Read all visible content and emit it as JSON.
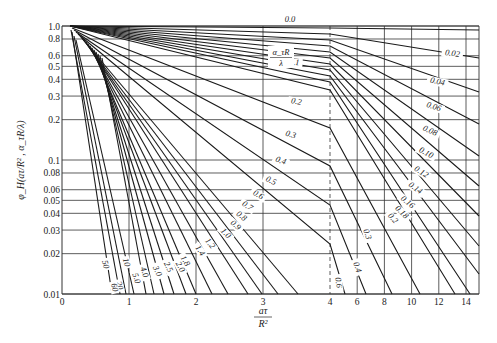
{
  "chart_data": {
    "type": "line",
    "title": "",
    "xlabel": "aτ/R²",
    "ylabel": "φ_H(aτ/R², α_τR/λ)",
    "yscale": "log",
    "ylim": [
      0.01,
      1.0
    ],
    "xlim": [
      0,
      15
    ],
    "x_axis_note": "Linear scale 0–4, compressed scale 4–14 beyond dashed line at 4",
    "x_ticks": [
      "0",
      "1",
      "2",
      "3",
      "4",
      "6",
      "8",
      "10",
      "12",
      "14"
    ],
    "y_ticks": [
      "1.0",
      "0.8",
      "0.6",
      "0.5",
      "0.4",
      "0.3",
      "0.2",
      "0.1",
      "0.08",
      "0.06",
      "0.05",
      "0.04",
      "0.03",
      "0.02",
      "0.01"
    ],
    "parameter_label": "α_τR/λ",
    "grid": true,
    "series": [
      {
        "name": "0.0",
        "px": [
          [
            70,
            26
          ],
          [
            330,
            28
          ],
          [
            479,
            30
          ]
        ]
      },
      {
        "name": "0.02",
        "px": [
          [
            70,
            26
          ],
          [
            330,
            34
          ],
          [
            479,
            58
          ]
        ]
      },
      {
        "name": "0.04",
        "px": [
          [
            70,
            26
          ],
          [
            330,
            40
          ],
          [
            479,
            92
          ]
        ]
      },
      {
        "name": "0.06",
        "px": [
          [
            70,
            26
          ],
          [
            330,
            46
          ],
          [
            479,
            124
          ]
        ]
      },
      {
        "name": "0.08",
        "px": [
          [
            70,
            26
          ],
          [
            330,
            52
          ],
          [
            479,
            156
          ]
        ]
      },
      {
        "name": "0.1",
        "px": [
          [
            70,
            26
          ],
          [
            330,
            58
          ],
          [
            479,
            186
          ]
        ]
      },
      {
        "name": "0.12",
        "px": [
          [
            70,
            26
          ],
          [
            330,
            64
          ],
          [
            479,
            216
          ]
        ]
      },
      {
        "name": "0.14",
        "px": [
          [
            70,
            26
          ],
          [
            330,
            70
          ],
          [
            479,
            246
          ]
        ]
      },
      {
        "name": "0.16",
        "px": [
          [
            70,
            26
          ],
          [
            330,
            76
          ],
          [
            479,
            274
          ]
        ]
      },
      {
        "name": "0.18",
        "px": [
          [
            70,
            26
          ],
          [
            330,
            82
          ],
          [
            470,
            294
          ]
        ]
      },
      {
        "name": "0.2",
        "px": [
          [
            70,
            26
          ],
          [
            330,
            90
          ],
          [
            455,
            294
          ]
        ]
      },
      {
        "name": "0.3",
        "px": [
          [
            72,
            28
          ],
          [
            330,
            128
          ],
          [
            420,
            294
          ]
        ]
      },
      {
        "name": "0.4",
        "px": [
          [
            74,
            30
          ],
          [
            330,
            166
          ],
          [
            392,
            294
          ]
        ]
      },
      {
        "name": "0.5",
        "px": [
          [
            76,
            32
          ],
          [
            330,
            205
          ],
          [
            366,
            294
          ]
        ]
      },
      {
        "name": "0.6",
        "px": [
          [
            78,
            34
          ],
          [
            330,
            244
          ],
          [
            345,
            294
          ]
        ]
      },
      {
        "name": "0.7",
        "px": [
          [
            80,
            36
          ],
          [
            298,
            294
          ]
        ]
      },
      {
        "name": "0.8",
        "px": [
          [
            82,
            38
          ],
          [
            278,
            294
          ]
        ]
      },
      {
        "name": "0.9",
        "px": [
          [
            84,
            40
          ],
          [
            262,
            294
          ]
        ]
      },
      {
        "name": "1.0",
        "px": [
          [
            86,
            42
          ],
          [
            248,
            294
          ]
        ]
      },
      {
        "name": "1.2",
        "px": [
          [
            88,
            44
          ],
          [
            228,
            294
          ]
        ]
      },
      {
        "name": "1.4",
        "px": [
          [
            90,
            46
          ],
          [
            212,
            294
          ]
        ]
      },
      {
        "name": "1.8",
        "px": [
          [
            92,
            48
          ],
          [
            196,
            294
          ]
        ]
      },
      {
        "name": "2.0",
        "px": [
          [
            94,
            50
          ],
          [
            186,
            294
          ]
        ]
      },
      {
        "name": "2.5",
        "px": [
          [
            96,
            52
          ],
          [
            174,
            294
          ]
        ]
      },
      {
        "name": "3.0",
        "px": [
          [
            98,
            54
          ],
          [
            164,
            294
          ]
        ]
      },
      {
        "name": "4.0",
        "px": [
          [
            100,
            56
          ],
          [
            154,
            294
          ]
        ]
      },
      {
        "name": "5.0",
        "px": [
          [
            102,
            58
          ],
          [
            146,
            294
          ]
        ]
      },
      {
        "name": "10",
        "px": [
          [
            76,
            40
          ],
          [
            134,
            294
          ]
        ]
      },
      {
        "name": "20",
        "px": [
          [
            74,
            36
          ],
          [
            126,
            294
          ]
        ]
      },
      {
        "name": "50",
        "px": [
          [
            72,
            32
          ],
          [
            112,
            294
          ]
        ]
      },
      {
        "name": "60",
        "px": [
          [
            71,
            30
          ],
          [
            120,
            294
          ]
        ]
      }
    ],
    "annotations": [
      {
        "text": "0.0",
        "x": 290,
        "y": 22,
        "rot": 0
      },
      {
        "text": "0.02",
        "x": 452,
        "y": 56,
        "rot": 8
      },
      {
        "text": "0.04",
        "x": 437,
        "y": 84,
        "rot": 12
      },
      {
        "text": "0.06",
        "x": 433,
        "y": 109,
        "rot": 18
      },
      {
        "text": "0.08",
        "x": 429,
        "y": 133,
        "rot": 24
      },
      {
        "text": "0.10",
        "x": 425,
        "y": 155,
        "rot": 28
      },
      {
        "text": "0.12",
        "x": 420,
        "y": 174,
        "rot": 32
      },
      {
        "text": "0.14",
        "x": 414,
        "y": 190,
        "rot": 36
      },
      {
        "text": "0.16",
        "x": 406,
        "y": 204,
        "rot": 40
      },
      {
        "text": "0.18",
        "x": 400,
        "y": 214,
        "rot": 44
      },
      {
        "text": "0.2",
        "x": 391,
        "y": 220,
        "rot": 48
      },
      {
        "text": "0.1",
        "x": 294,
        "y": 65,
        "rot": 4
      },
      {
        "text": "0.2",
        "x": 296,
        "y": 104,
        "rot": 10
      },
      {
        "text": "0.3",
        "x": 290,
        "y": 137,
        "rot": 16
      },
      {
        "text": "0.4",
        "x": 280,
        "y": 163,
        "rot": 20
      },
      {
        "text": "0.5",
        "x": 270,
        "y": 183,
        "rot": 24
      },
      {
        "text": "0.6",
        "x": 257,
        "y": 197,
        "rot": 30
      },
      {
        "text": "0.7",
        "x": 246,
        "y": 208,
        "rot": 34
      },
      {
        "text": "0.8",
        "x": 240,
        "y": 218,
        "rot": 38
      },
      {
        "text": "0.9",
        "x": 234,
        "y": 227,
        "rot": 42
      },
      {
        "text": "1.0",
        "x": 224,
        "y": 235,
        "rot": 46
      },
      {
        "text": "1.2",
        "x": 208,
        "y": 245,
        "rot": 52
      },
      {
        "text": "1.4",
        "x": 198,
        "y": 252,
        "rot": 56
      },
      {
        "text": "1.8",
        "x": 183,
        "y": 262,
        "rot": 60
      },
      {
        "text": "2.0",
        "x": 178,
        "y": 268,
        "rot": 62
      },
      {
        "text": "2.5",
        "x": 166,
        "y": 268,
        "rot": 64
      },
      {
        "text": "3.0",
        "x": 155,
        "y": 272,
        "rot": 66
      },
      {
        "text": "4.0",
        "x": 142,
        "y": 273,
        "rot": 70
      },
      {
        "text": "5.0",
        "x": 134,
        "y": 279,
        "rot": 72
      },
      {
        "text": "10",
        "x": 124,
        "y": 263,
        "rot": 74
      },
      {
        "text": "20",
        "x": 117,
        "y": 286,
        "rot": 76
      },
      {
        "text": "50",
        "x": 103,
        "y": 265,
        "rot": 76
      },
      {
        "text": "60",
        "x": 112,
        "y": 288,
        "rot": 76
      },
      {
        "text": "0.3",
        "x": 365,
        "y": 235,
        "rot": 72
      },
      {
        "text": "0.4",
        "x": 355,
        "y": 268,
        "rot": 72
      },
      {
        "text": "0.6",
        "x": 336,
        "y": 283,
        "rot": 82
      }
    ]
  },
  "axes": {
    "xlabel_num": "aτ",
    "xlabel_den": "R²",
    "ylabel": "φ_H(aτ/R² , α_τR/λ)",
    "param_num": "α_τR",
    "param_den": "λ"
  },
  "colors": {
    "line": "#1a1a1a",
    "grid": "#333333",
    "background": "#ffffff"
  }
}
